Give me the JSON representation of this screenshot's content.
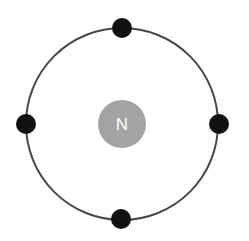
{
  "diagram": {
    "type": "bohr-atom-model",
    "nucleus": {
      "label": "N",
      "color": "#a3a3a3",
      "cx": 122,
      "cy": 124,
      "r": 24
    },
    "orbit": {
      "cx": 122,
      "cy": 124,
      "r": 96,
      "stroke": "#474747",
      "stroke_width": 2
    },
    "electron_color": "#111111",
    "electrons": [
      {
        "position": "top",
        "cx": 122,
        "cy": 28,
        "r": 10
      },
      {
        "position": "left",
        "cx": 26,
        "cy": 124,
        "r": 10
      },
      {
        "position": "right",
        "cx": 219,
        "cy": 124,
        "r": 10
      },
      {
        "position": "bottom",
        "cx": 121,
        "cy": 219,
        "r": 10
      }
    ]
  }
}
